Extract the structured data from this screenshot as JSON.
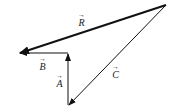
{
  "diagram": {
    "type": "vector-addition",
    "vectors": [
      {
        "name": "R",
        "label": "R",
        "from": [
          166,
          5
        ],
        "to": [
          19,
          53
        ],
        "style": "thick"
      },
      {
        "name": "B",
        "label": "B",
        "from": [
          68,
          53
        ],
        "to": [
          19,
          53
        ],
        "style": "thin"
      },
      {
        "name": "A",
        "label": "A",
        "from": [
          68,
          105
        ],
        "to": [
          68,
          54
        ],
        "style": "thin"
      },
      {
        "name": "C",
        "label": "C",
        "from": [
          166,
          5
        ],
        "to": [
          69,
          105
        ],
        "style": "thin"
      }
    ],
    "arrow_glyph": "→",
    "line_color": "#111111"
  }
}
